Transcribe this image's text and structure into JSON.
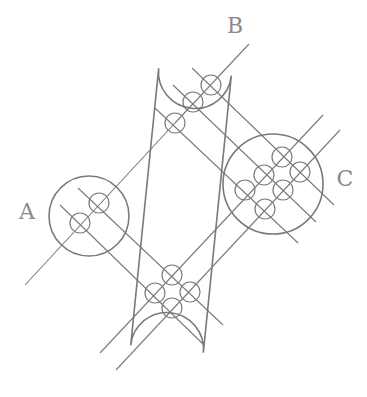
{
  "diagram": {
    "type": "venn-like set diagram with grouped elements",
    "stroke_color": "#7a7a7a",
    "label_color": "#8a8a8a",
    "background": "#ffffff",
    "labels": [
      {
        "id": "A",
        "text": "A",
        "x": 27,
        "y": 219
      },
      {
        "id": "B",
        "text": "B",
        "x": 235,
        "y": 33
      },
      {
        "id": "C",
        "text": "C",
        "x": 345,
        "y": 186
      }
    ],
    "groups": [
      {
        "id": "A",
        "shape": "circle",
        "cx": 89,
        "cy": 216,
        "r": 40
      },
      {
        "id": "B",
        "shape": "capsule",
        "top_center": [
          195,
          72
        ],
        "bottom_center": [
          167,
          349
        ],
        "radius": 36.5
      },
      {
        "id": "C",
        "shape": "circle",
        "cx": 273,
        "cy": 184,
        "r": 50
      }
    ],
    "nodes": [
      {
        "group": "A",
        "cx": 80,
        "cy": 223,
        "r": 10
      },
      {
        "group": "A",
        "cx": 99,
        "cy": 203,
        "r": 10
      },
      {
        "group": "B",
        "cx": 211,
        "cy": 85,
        "r": 10
      },
      {
        "group": "B",
        "cx": 193,
        "cy": 102,
        "r": 10
      },
      {
        "group": "B",
        "cx": 175,
        "cy": 123,
        "r": 10
      },
      {
        "group": "B",
        "cx": 172,
        "cy": 275,
        "r": 10
      },
      {
        "group": "B",
        "cx": 155,
        "cy": 293,
        "r": 10
      },
      {
        "group": "B",
        "cx": 190,
        "cy": 292,
        "r": 10
      },
      {
        "group": "B",
        "cx": 172,
        "cy": 308,
        "r": 10
      },
      {
        "group": "C",
        "cx": 282,
        "cy": 157,
        "r": 10
      },
      {
        "group": "C",
        "cx": 300,
        "cy": 172,
        "r": 10
      },
      {
        "group": "C",
        "cx": 264,
        "cy": 175,
        "r": 10
      },
      {
        "group": "C",
        "cx": 283,
        "cy": 190,
        "r": 10
      },
      {
        "group": "C",
        "cx": 245,
        "cy": 190,
        "r": 10
      },
      {
        "group": "C",
        "cx": 265,
        "cy": 209,
        "r": 10
      }
    ],
    "lines": [
      {
        "x1": 25,
        "y1": 285,
        "x2": 175,
        "y2": 123
      },
      {
        "x1": 175,
        "y1": 123,
        "x2": 249,
        "y2": 44
      },
      {
        "x1": 192,
        "y1": 68,
        "x2": 334,
        "y2": 205
      },
      {
        "x1": 173,
        "y1": 85,
        "x2": 316,
        "y2": 222
      },
      {
        "x1": 155,
        "y1": 108,
        "x2": 298,
        "y2": 243
      },
      {
        "x1": 78,
        "y1": 188,
        "x2": 223,
        "y2": 325
      },
      {
        "x1": 60,
        "y1": 205,
        "x2": 204,
        "y2": 345
      },
      {
        "x1": 323,
        "y1": 115,
        "x2": 100,
        "y2": 353
      },
      {
        "x1": 340,
        "y1": 130,
        "x2": 116,
        "y2": 370
      }
    ]
  }
}
